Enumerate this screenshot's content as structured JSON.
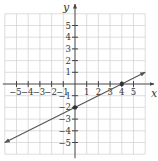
{
  "chart_data": {
    "type": "line",
    "title": "",
    "xlabel": "x",
    "ylabel": "y",
    "xlim": [
      -6,
      6
    ],
    "ylim": [
      -6,
      6
    ],
    "grid": true,
    "x_ticks": [
      -5,
      -4,
      -3,
      -2,
      -1,
      1,
      2,
      3,
      4,
      5
    ],
    "y_ticks": [
      5,
      4,
      3,
      2,
      1,
      -1,
      -2,
      -3,
      -4,
      -5
    ],
    "x_tick_labels": [
      "−5",
      "−4",
      "−3",
      "−2",
      "−1",
      "1",
      "2",
      "3",
      "4",
      "5"
    ],
    "y_tick_labels": [
      "5",
      "4",
      "3",
      "2",
      "1",
      "−1",
      "−2",
      "−3",
      "−4",
      "−5"
    ],
    "series": [
      {
        "name": "line",
        "equation": "y = x/2 - 2",
        "slope": 0.5,
        "intercept": -2,
        "x": [
          -6,
          6
        ],
        "y": [
          -5,
          1
        ],
        "arrows": "both"
      }
    ],
    "points": [
      {
        "x": 0,
        "y": -2,
        "label": "y-intercept"
      },
      {
        "x": 4,
        "y": 0,
        "label": "x-intercept"
      }
    ],
    "colors": {
      "grid": "#d0d0d0",
      "axis": "#444444",
      "line": "#555555",
      "point": "#333333"
    }
  }
}
